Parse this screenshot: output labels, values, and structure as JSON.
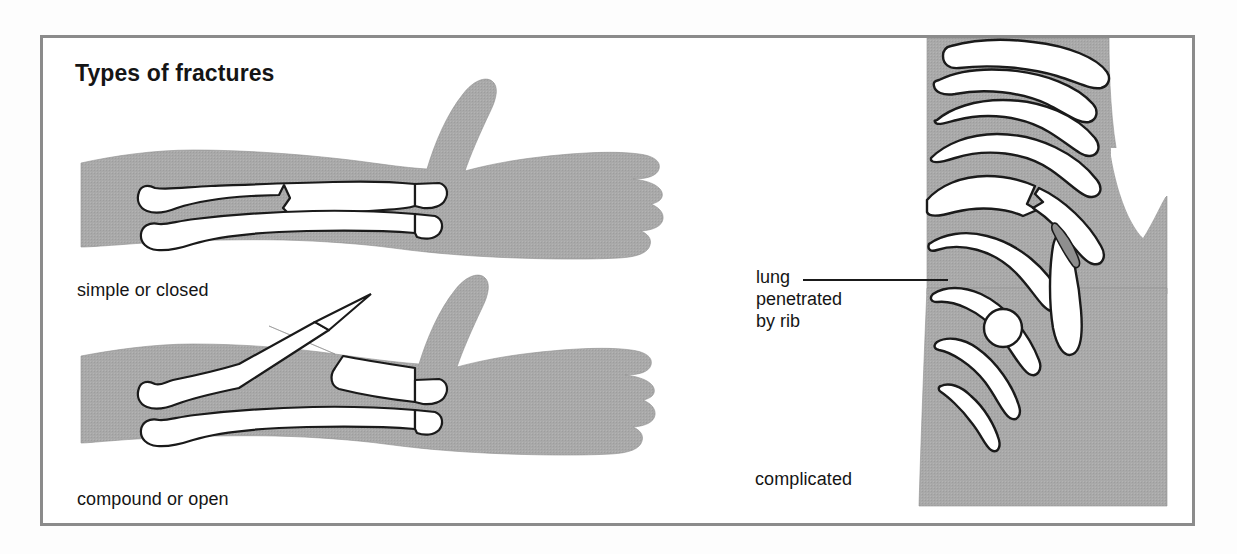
{
  "figure": {
    "title": "Types of fractures",
    "border_color": "#8b8b8b",
    "background_color": "#ffffff",
    "flesh_color": "#a8a8a8",
    "bone_color": "#ffffff",
    "outline_color": "#1a1a1a",
    "text_color": "#151515"
  },
  "panels": [
    {
      "id": "simple-closed",
      "caption": "simple or closed",
      "subject": "forearm-with-hand",
      "description": "forearm showing two bones, upper bone with a jagged crack but skin intact"
    },
    {
      "id": "compound-open",
      "caption": "compound or open",
      "subject": "forearm-with-hand",
      "description": "forearm showing broken upper bone whose sharp end protrudes through the skin"
    },
    {
      "id": "complicated",
      "caption": "complicated",
      "subject": "rib-cage-torso",
      "description": "side view of rib cage where a fractured rib end penetrates the lung"
    }
  ],
  "annotations": {
    "lung": {
      "lines": [
        "lung",
        "penetrated",
        "by rib"
      ],
      "leader_line": true
    }
  }
}
